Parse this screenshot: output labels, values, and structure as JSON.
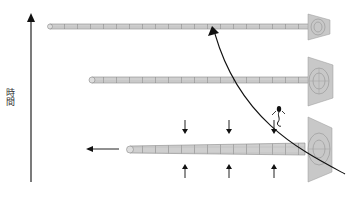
{
  "diagram": {
    "axis": {
      "label": "時間",
      "direction": "up",
      "icon": "arrow-up-icon"
    },
    "stages": [
      {
        "id": "top",
        "tube_left_x": 48,
        "y": 27,
        "funnel_x": 300
      },
      {
        "id": "middle",
        "tube_left_x": 90,
        "y": 80,
        "funnel_x": 300
      },
      {
        "id": "bottom",
        "tube_left_x": 128,
        "y": 150,
        "funnel_x": 300
      }
    ],
    "annotations": {
      "pull_arrow": {
        "icon": "arrow-left-icon",
        "direction": "left"
      },
      "compression_arrows": {
        "top_icon": "arrow-down-icon",
        "bottom_icon": "arrow-up-icon",
        "count": 3
      },
      "trajectory_curve": {
        "icon": "curved-arrow-icon"
      },
      "figure": {
        "icon": "sperm-figure-icon"
      }
    },
    "colors": {
      "tube_fill": "#cfcfcf",
      "tube_stroke": "#8a8a8a",
      "funnel_fill": "#c8c8c8",
      "line": "#111111"
    }
  }
}
